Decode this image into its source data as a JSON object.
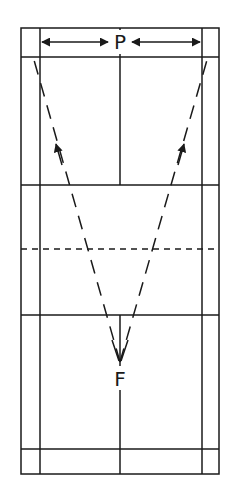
{
  "diagram": {
    "type": "badminton-court",
    "labels": {
      "top": "P",
      "bottom": "F"
    },
    "line_color": "#1a1a1a",
    "background": "#ffffff",
    "elements": {
      "top_arrows": "double-headed width arrows pointing to P from both sidelines",
      "dashed_paths": "two dashed arrows from F to the back corners"
    }
  }
}
